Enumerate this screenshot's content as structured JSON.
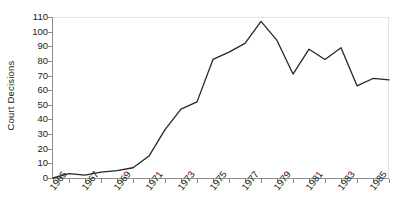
{
  "chart_data": {
    "type": "line",
    "title": "",
    "xlabel": "",
    "ylabel": "Court Decisions",
    "ylim": [
      0,
      110
    ],
    "xlim": [
      1965,
      1986
    ],
    "ytick_step": 10,
    "xtick_step": 1,
    "grid": false,
    "legend": false,
    "legend_position": "none",
    "line_color": "#262626",
    "axis_color": "#8c8c8c",
    "frame_color": "#e3e3e3",
    "text_color": "#1a1a1a",
    "ytick_labels": [
      "110",
      "100",
      "90",
      "80",
      "70",
      "60",
      "50",
      "40",
      "30",
      "20",
      "10",
      "0"
    ],
    "ytick_values": [
      110,
      100,
      90,
      80,
      70,
      60,
      50,
      40,
      30,
      20,
      10,
      0
    ],
    "xtick_labels": [
      "1965",
      "1967",
      "1969",
      "1971",
      "1973",
      "1975",
      "1977",
      "1979",
      "1981",
      "1983",
      "1985"
    ],
    "xtick_values": [
      1965,
      1967,
      1969,
      1971,
      1973,
      1975,
      1977,
      1979,
      1981,
      1983,
      1985
    ],
    "x": [
      1965,
      1966,
      1967,
      1968,
      1969,
      1970,
      1971,
      1972,
      1973,
      1974,
      1975,
      1976,
      1977,
      1978,
      1979,
      1980,
      1981,
      1982,
      1983,
      1984,
      1985,
      1986
    ],
    "values": [
      0,
      3,
      2,
      4,
      5,
      7,
      15,
      33,
      47,
      52,
      81,
      86,
      92,
      107,
      94,
      71,
      88,
      81,
      89,
      63,
      68,
      67
    ],
    "series": [
      {
        "name": "Court Decisions",
        "values": [
          0,
          3,
          2,
          4,
          5,
          7,
          15,
          33,
          47,
          52,
          81,
          86,
          92,
          107,
          94,
          71,
          88,
          81,
          89,
          63,
          68,
          67
        ]
      }
    ]
  }
}
